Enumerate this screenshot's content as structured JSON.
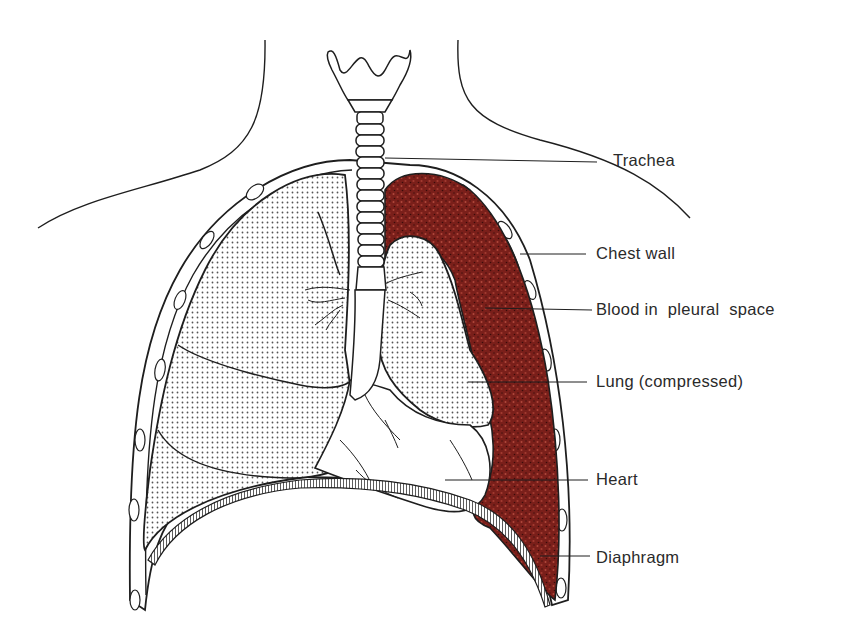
{
  "figure": {
    "colors": {
      "blood": "#7a1f1a",
      "blood_speckle": "#b0473a",
      "lung_stipple": "#555555",
      "outline": "#1e1e1e",
      "background": "#ffffff"
    }
  },
  "labels": [
    {
      "id": "trachea",
      "text": "Trachea"
    },
    {
      "id": "chest_wall",
      "text": "Chest wall"
    },
    {
      "id": "blood",
      "text": "Blood in  pleural  space"
    },
    {
      "id": "lung",
      "text": "Lung (compressed)"
    },
    {
      "id": "heart",
      "text": "Heart"
    },
    {
      "id": "diaphragm",
      "text": "Diaphragm"
    }
  ]
}
